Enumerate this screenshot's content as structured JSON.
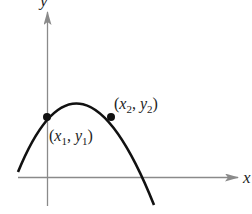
{
  "figure": {
    "type": "coordinate-plane-diagram",
    "axes": {
      "x_label": "x",
      "y_label": "y",
      "axis_color": "#8a8a8a"
    },
    "curve": {
      "kind": "parabola",
      "opens": "down",
      "color": "#111111"
    },
    "points": [
      {
        "name": "point-1",
        "label_open": "(",
        "var_x": "x",
        "sub_x": "1",
        "sep": ", ",
        "var_y": "y",
        "sub_y": "1",
        "label_close": ")"
      },
      {
        "name": "point-2",
        "label_open": "(",
        "var_x": "x",
        "sub_x": "2",
        "sep": ", ",
        "var_y": "y",
        "sub_y": "2",
        "label_close": ")"
      }
    ]
  }
}
